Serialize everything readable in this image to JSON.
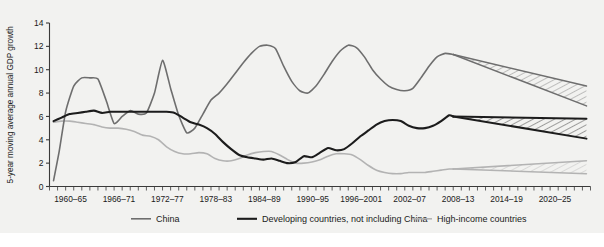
{
  "colors": {
    "background": "#f2f2f0",
    "china": "#6e6e6e",
    "developing": "#1c1c1c",
    "high_income": "#b3b3b3",
    "axis": "#3a3a3a",
    "text": "#1a1a1a"
  },
  "axis": {
    "ylabel": "5-year moving average annual GDP growth",
    "yticks": [
      "0",
      "2",
      "4",
      "6",
      "8",
      "10",
      "12",
      "14"
    ],
    "xticklabels": [
      "1960–65",
      "1966–71",
      "1972–77",
      "1978–83",
      "1984–89",
      "1990–95",
      "1996–2001",
      "2002–07",
      "2008–13",
      "2014–19",
      "2020–25"
    ]
  },
  "legend": {
    "items": [
      {
        "label": "China",
        "color": "#6e6e6e",
        "width": 1.6
      },
      {
        "label": "Developing countries, not including China",
        "color": "#1c1c1c",
        "width": 2.1
      },
      {
        "label": "High-income countries",
        "color": "#b3b3b3",
        "width": 1.6
      }
    ]
  },
  "chart_data": {
    "type": "line",
    "title": "",
    "xlabel": "",
    "ylabel": "5-year moving average annual GDP growth",
    "ylim": [
      0,
      14
    ],
    "xlim": [
      1960,
      2027
    ],
    "grid": false,
    "legend_position": "bottom",
    "categories": [
      "1960–65",
      "1966–71",
      "1972–77",
      "1978–83",
      "1984–89",
      "1990–95",
      "1996–2001",
      "2002–07",
      "2008–13",
      "2014–19",
      "2020–25"
    ],
    "series": [
      {
        "name": "China",
        "color": "#6e6e6e",
        "x": [
          1960.5,
          1961.2,
          1962.0,
          1963.0,
          1964.0,
          1965.0,
          1966.0,
          1967.0,
          1968.0,
          1969.0,
          1970.0,
          1971.0,
          1972.0,
          1973.0,
          1974.0,
          1975.0,
          1976.0,
          1977.0,
          1978.0,
          1979.0,
          1980.0,
          1981.0,
          1982.0,
          1983.0,
          1984.0,
          1985.0,
          1986.0,
          1987.0,
          1988.0,
          1989.0,
          1990.0,
          1991.0,
          1992.0,
          1993.0,
          1994.0,
          1995.0,
          1996.0,
          1997.0,
          1998.0,
          1999.0,
          2000.0,
          2001.0,
          2002.0,
          2003.0,
          2004.0,
          2005.0,
          2006.0,
          2007.0,
          2008.0,
          2009.0,
          2010.0
        ],
        "y": [
          0.5,
          3.0,
          6.4,
          8.6,
          9.3,
          9.3,
          9.2,
          7.4,
          5.4,
          6.0,
          6.5,
          6.2,
          6.3,
          8.0,
          10.8,
          8.4,
          6.1,
          4.6,
          5.0,
          6.2,
          7.4,
          8.0,
          8.8,
          9.7,
          10.6,
          11.4,
          12.0,
          12.1,
          11.8,
          10.3,
          9.0,
          8.2,
          8.0,
          8.6,
          9.6,
          10.7,
          11.6,
          12.1,
          11.9,
          11.1,
          10.0,
          9.2,
          8.6,
          8.3,
          8.2,
          8.4,
          9.3,
          10.3,
          11.1,
          11.4,
          11.3
        ]
      },
      {
        "name": "Developing countries, not including China",
        "color": "#1c1c1c",
        "x": [
          1960.5,
          1961.5,
          1962.5,
          1963.5,
          1964.5,
          1965.5,
          1966.5,
          1967.5,
          1968.5,
          1969.5,
          1970.5,
          1971.5,
          1972.5,
          1973.5,
          1974.5,
          1975.5,
          1976.5,
          1977.5,
          1978.5,
          1979.5,
          1980.5,
          1981.5,
          1982.5,
          1983.5,
          1984.5,
          1985.5,
          1986.5,
          1987.5,
          1988.5,
          1989.5,
          1990.5,
          1991.5,
          1992.5,
          1993.5,
          1994.5,
          1995.5,
          1996.5,
          1997.5,
          1998.5,
          1999.5,
          2000.5,
          2001.5,
          2002.5,
          2003.5,
          2004.5,
          2005.5,
          2006.5,
          2007.5,
          2008.5,
          2009.5,
          2010.0
        ],
        "y": [
          5.6,
          5.9,
          6.2,
          6.3,
          6.4,
          6.5,
          6.3,
          6.4,
          6.4,
          6.4,
          6.4,
          6.4,
          6.4,
          6.4,
          6.4,
          6.3,
          5.9,
          5.5,
          5.3,
          5.0,
          4.5,
          3.8,
          3.2,
          2.7,
          2.5,
          2.4,
          2.3,
          2.4,
          2.2,
          2.0,
          2.1,
          2.6,
          2.5,
          2.9,
          3.3,
          3.1,
          3.2,
          3.7,
          4.3,
          4.8,
          5.3,
          5.6,
          5.7,
          5.6,
          5.2,
          5.0,
          5.0,
          5.2,
          5.6,
          6.1,
          6.0
        ]
      },
      {
        "name": "High-income countries",
        "color": "#b3b3b3",
        "x": [
          1960.5,
          1961.5,
          1962.5,
          1963.5,
          1964.5,
          1965.5,
          1966.5,
          1967.5,
          1968.5,
          1969.5,
          1970.5,
          1971.5,
          1972.5,
          1973.5,
          1974.5,
          1975.5,
          1976.5,
          1977.5,
          1978.5,
          1979.5,
          1980.5,
          1981.5,
          1982.5,
          1983.5,
          1984.5,
          1985.5,
          1986.5,
          1987.5,
          1988.5,
          1989.5,
          1990.5,
          1991.5,
          1992.5,
          1993.5,
          1994.5,
          1995.5,
          1996.5,
          1997.5,
          1998.5,
          1999.5,
          2000.5,
          2001.5,
          2002.5,
          2003.5,
          2004.5,
          2005.5,
          2006.5,
          2007.5,
          2008.5,
          2009.5,
          2010.0
        ],
        "y": [
          5.5,
          5.6,
          5.6,
          5.5,
          5.4,
          5.3,
          5.1,
          5.0,
          5.0,
          4.9,
          4.7,
          4.4,
          4.3,
          4.0,
          3.4,
          3.0,
          2.8,
          2.8,
          2.9,
          2.8,
          2.4,
          2.2,
          2.2,
          2.4,
          2.7,
          2.9,
          3.0,
          3.0,
          2.7,
          2.3,
          2.0,
          2.0,
          2.1,
          2.3,
          2.6,
          2.8,
          2.8,
          2.7,
          2.3,
          1.8,
          1.4,
          1.2,
          1.1,
          1.1,
          1.2,
          1.2,
          1.2,
          1.3,
          1.4,
          1.5,
          1.5
        ]
      }
    ],
    "projections": [
      {
        "name": "China projection",
        "color": "#6e6e6e",
        "x_start": 2010.0,
        "x_end": 2026.5,
        "upper_start": 11.3,
        "upper_end": 8.6,
        "lower_start": 11.3,
        "lower_end": 6.9,
        "hatched": true
      },
      {
        "name": "Developing countries projection",
        "color": "#1c1c1c",
        "x_start": 2010.0,
        "x_end": 2026.5,
        "upper_start": 6.0,
        "upper_end": 5.8,
        "lower_start": 6.0,
        "lower_end": 4.1,
        "hatched": true
      },
      {
        "name": "High-income countries projection",
        "color": "#b3b3b3",
        "x_start": 2010.0,
        "x_end": 2026.5,
        "upper_start": 1.5,
        "upper_end": 2.2,
        "lower_start": 1.5,
        "lower_end": 1.1,
        "hatched": true
      }
    ]
  }
}
